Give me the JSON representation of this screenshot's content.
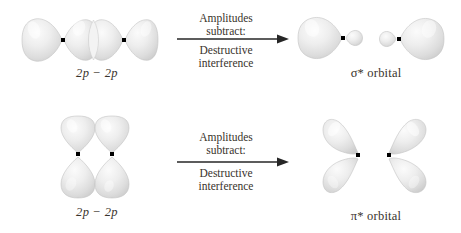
{
  "colors": {
    "background": "#ffffff",
    "text": "#39332c",
    "arrow": "#262626",
    "lobe_fill": "#e3e3e3",
    "lobe_edge": "#c2c2c2",
    "lobe_highlight": "#fafafa",
    "node_dot": "#000000"
  },
  "figures": {
    "top_reactant": "two-2p-orbitals-end-on",
    "top_product": "sigma-star-antibonding-orbital",
    "bottom_reactant": "two-2p-orbitals-side-by-side",
    "bottom_product": "pi-star-antibonding-orbital"
  },
  "top_row": {
    "reactant_label": "2p − 2p",
    "arrow_label_above": "Amplitudes\nsubtract:",
    "arrow_label_below": "Destructive\ninterference",
    "product_label": "σ* orbital"
  },
  "bottom_row": {
    "reactant_label": "2p − 2p",
    "arrow_label_above": "Amplitudes\nsubtract:",
    "arrow_label_below": "Destructive\ninterference",
    "product_label": "π* orbital"
  }
}
